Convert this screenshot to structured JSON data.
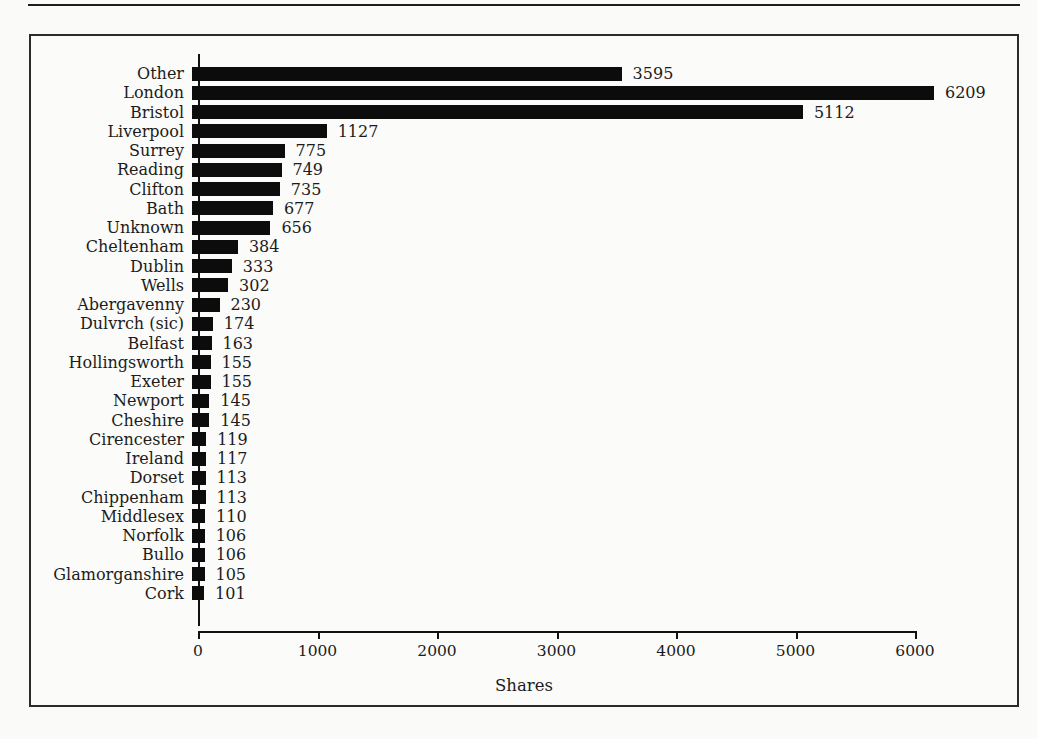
{
  "frame": {
    "background": "#fbfbf9",
    "border_color": "#2b2b2b",
    "top_rule_color": "#1e1e1e"
  },
  "chart_data": {
    "type": "bar",
    "orientation": "horizontal",
    "title": "",
    "xlabel": "Shares",
    "ylabel": "",
    "categories": [
      "Other",
      "London",
      "Bristol",
      "Liverpool",
      "Surrey",
      "Reading",
      "Clifton",
      "Bath",
      "Unknown",
      "Cheltenham",
      "Dublin",
      "Wells",
      "Abergavenny",
      "Dulvrch (sic)",
      "Belfast",
      "Hollingsworth",
      "Exeter",
      "Newport",
      "Cheshire",
      "Cirencester",
      "Ireland",
      "Dorset",
      "Chippenham",
      "Middlesex",
      "Norfolk",
      "Bullo",
      "Glamorganshire",
      "Cork"
    ],
    "values": [
      3595,
      6209,
      5112,
      1127,
      775,
      749,
      735,
      677,
      656,
      384,
      333,
      302,
      230,
      174,
      163,
      155,
      155,
      145,
      145,
      119,
      117,
      113,
      113,
      110,
      106,
      106,
      105,
      101
    ],
    "value_labels_shown": true,
    "xlim": [
      0,
      6000
    ],
    "xticks": [
      "0",
      "1000",
      "2000",
      "3000",
      "4000",
      "5000",
      "6000"
    ],
    "grid": false,
    "legend_position": "none",
    "bar_color": "#0c0c0c",
    "text_color": "#1c1c1c"
  }
}
